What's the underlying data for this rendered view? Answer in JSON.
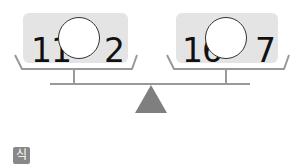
{
  "scale": {
    "left_pan": {
      "left_number": "11",
      "right_number": "2",
      "blank": ""
    },
    "right_pan": {
      "left_number": "16",
      "right_number": "7",
      "blank": ""
    }
  },
  "answer_label": "식",
  "colors": {
    "box": "#e4e4e4",
    "line": "#999999",
    "fulcrum": "#7f7f7f",
    "badge": "#888888"
  }
}
